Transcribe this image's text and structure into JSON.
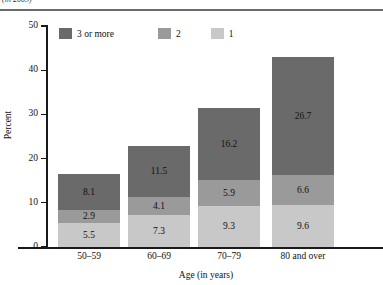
{
  "header": {
    "clipped_text": "(in 2003)",
    "note": "top line of text is cut off at the image edge"
  },
  "chart_data": {
    "type": "bar",
    "subtype": "stacked-bar-vertical",
    "title": "",
    "xlabel": "Age (in years)",
    "ylabel": "Percent",
    "categories": [
      "50–59",
      "60–69",
      "70–79",
      "80 and over"
    ],
    "series": [
      {
        "name": "1",
        "values": [
          5.5,
          7.3,
          9.3,
          9.6
        ],
        "color": "#c8c8c8",
        "stack_order": 0
      },
      {
        "name": "2",
        "values": [
          2.9,
          4.1,
          5.9,
          6.6
        ],
        "color": "#9a9a9a",
        "stack_order": 1
      },
      {
        "name": "3 or more",
        "values": [
          8.1,
          11.5,
          16.2,
          26.7
        ],
        "color": "#6a6a6a",
        "stack_order": 2
      }
    ],
    "totals": [
      16.5,
      22.9,
      31.4,
      42.9
    ],
    "ylim": [
      0,
      50
    ],
    "yticks": [
      0,
      10,
      20,
      30,
      40,
      50
    ],
    "ytick_labels": [
      "0",
      "10",
      "20",
      "30",
      "40",
      "50"
    ],
    "grid": false,
    "legend_position": "top-left-inside",
    "legend_order": [
      "3 or more",
      "2",
      "1"
    ]
  },
  "legend": {
    "entries": [
      {
        "label": "3 or more",
        "color": "#6a6a6a"
      },
      {
        "label": "2",
        "color": "#9a9a9a"
      },
      {
        "label": "1",
        "color": "#c8c8c8"
      }
    ]
  },
  "axes": {
    "y_title": "Percent",
    "x_title": "Age (in years)",
    "y_tick_labels": [
      "50",
      "40",
      "30",
      "20",
      "10",
      "0"
    ],
    "x_tick_labels": [
      "50–59",
      "60–69",
      "70–79",
      "80 and over"
    ]
  },
  "bars": [
    {
      "category": "50–59",
      "segments": [
        {
          "series": "3 or more",
          "value": "8.1"
        },
        {
          "series": "2",
          "value": "2.9"
        },
        {
          "series": "1",
          "value": "5.5"
        }
      ]
    },
    {
      "category": "60–69",
      "segments": [
        {
          "series": "3 or more",
          "value": "11.5"
        },
        {
          "series": "2",
          "value": "4.1"
        },
        {
          "series": "1",
          "value": "7.3"
        }
      ]
    },
    {
      "category": "70–79",
      "segments": [
        {
          "series": "3 or more",
          "value": "16.2"
        },
        {
          "series": "2",
          "value": "5.9"
        },
        {
          "series": "1",
          "value": "9.3"
        }
      ]
    },
    {
      "category": "80 and over",
      "segments": [
        {
          "series": "3 or more",
          "value": "26.7"
        },
        {
          "series": "2",
          "value": "6.6"
        },
        {
          "series": "1",
          "value": "9.6"
        }
      ]
    }
  ]
}
